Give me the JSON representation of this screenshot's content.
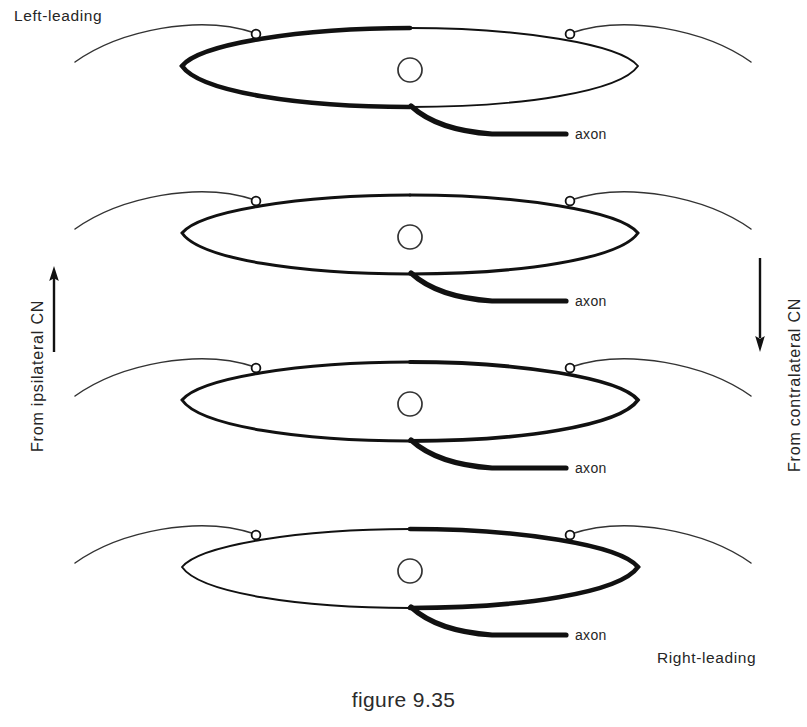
{
  "figure": {
    "caption": "figure 9.35",
    "corner_labels": {
      "top_left": "Left-leading",
      "bottom_right": "Right-leading"
    },
    "side_labels": {
      "left": "From ipsilateral CN",
      "right": "From contralateral CN"
    },
    "arrows": {
      "left_direction": "up",
      "right_direction": "down"
    },
    "colors": {
      "ink": "#111111",
      "thin_fiber": "#333333",
      "background": "#ffffff"
    }
  },
  "cells": [
    {
      "index": 1,
      "axon_label": "axon",
      "nucleus_label": "nucleus",
      "left_bouton_label": "synaptic-bouton",
      "right_bouton_label": "synaptic-bouton",
      "soma_left_weight": "thick",
      "soma_right_weight": "thin"
    },
    {
      "index": 2,
      "axon_label": "axon",
      "nucleus_label": "nucleus",
      "left_bouton_label": "synaptic-bouton",
      "right_bouton_label": "synaptic-bouton",
      "soma_left_weight": "medium",
      "soma_right_weight": "medium"
    },
    {
      "index": 3,
      "axon_label": "axon",
      "nucleus_label": "nucleus",
      "left_bouton_label": "synaptic-bouton",
      "right_bouton_label": "synaptic-bouton",
      "soma_left_weight": "medium",
      "soma_right_weight": "medium-thick"
    },
    {
      "index": 4,
      "axon_label": "axon",
      "nucleus_label": "nucleus",
      "left_bouton_label": "synaptic-bouton",
      "right_bouton_label": "synaptic-bouton",
      "soma_left_weight": "thin",
      "soma_right_weight": "thick"
    }
  ]
}
